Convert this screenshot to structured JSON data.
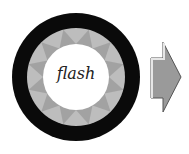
{
  "diagram": {
    "center_label": "flash",
    "colors": {
      "outer_ring": "#0a0a0a",
      "middle_ring_light": "#bdbdbd",
      "middle_ring_dark": "#8c8c8c",
      "inner_circle": "#ffffff",
      "arrow_fill": "#9a9a9a",
      "arrow_stroke": "#555555"
    }
  }
}
